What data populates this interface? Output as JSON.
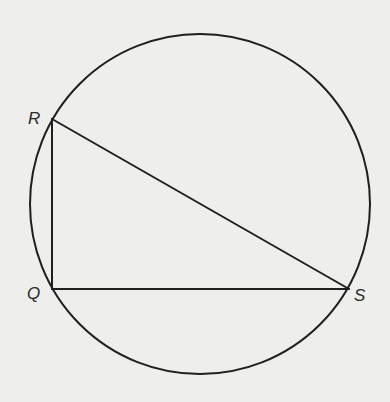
{
  "figure": {
    "background": "#eeeeec",
    "stroke_color": "#1f1f1f",
    "circle": {
      "cx": 200,
      "cy": 204,
      "r": 170
    },
    "points": {
      "R": {
        "x": 52,
        "y": 119,
        "label": "R"
      },
      "Q": {
        "x": 52,
        "y": 289,
        "label": "Q"
      },
      "S": {
        "x": 349,
        "y": 289,
        "label": "S"
      }
    },
    "segments": [
      {
        "name": "RQ",
        "from": "R",
        "to": "Q"
      },
      {
        "name": "QS",
        "from": "Q",
        "to": "S"
      },
      {
        "name": "RS",
        "from": "R",
        "to": "S"
      }
    ],
    "labels": {
      "R": "R",
      "Q": "Q",
      "S": "S"
    }
  }
}
